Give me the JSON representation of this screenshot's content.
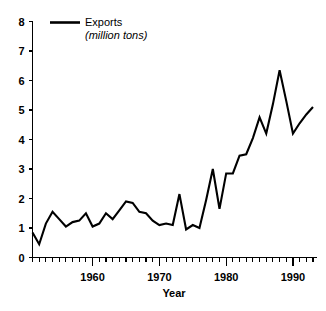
{
  "chart_data": {
    "type": "line",
    "title": "",
    "xlabel": "Year",
    "ylabel": "",
    "xlim": [
      1951,
      1993
    ],
    "ylim": [
      0,
      8
    ],
    "grid": false,
    "legend_position": "top-left-inside",
    "legend": [
      {
        "label": "Exports",
        "sublabel": "(million tons)",
        "color": "#000000"
      }
    ],
    "y_ticks": [
      0,
      1,
      2,
      3,
      4,
      5,
      6,
      7,
      8
    ],
    "y_tick_labels": [
      "0",
      "1",
      "2",
      "3",
      "4",
      "5",
      "6",
      "7",
      "8"
    ],
    "x_ticks": [
      1960,
      1970,
      1980,
      1990
    ],
    "x_tick_labels": [
      "1960",
      "1970",
      "1980",
      "1990"
    ],
    "x_minor_tick_step": 1,
    "series": [
      {
        "name": "Exports",
        "x": [
          1951,
          1952,
          1953,
          1954,
          1955,
          1956,
          1957,
          1958,
          1959,
          1960,
          1961,
          1962,
          1963,
          1964,
          1965,
          1966,
          1967,
          1968,
          1969,
          1970,
          1971,
          1972,
          1973,
          1974,
          1975,
          1976,
          1977,
          1978,
          1979,
          1980,
          1981,
          1982,
          1983,
          1984,
          1985,
          1986,
          1987,
          1988,
          1989,
          1990,
          1991,
          1992,
          1993
        ],
        "values": [
          0.85,
          0.45,
          1.15,
          1.55,
          1.3,
          1.05,
          1.2,
          1.25,
          1.5,
          1.05,
          1.15,
          1.5,
          1.3,
          1.6,
          1.9,
          1.85,
          1.55,
          1.5,
          1.25,
          1.1,
          1.15,
          1.1,
          2.15,
          0.95,
          1.1,
          1.0,
          1.95,
          3.0,
          1.65,
          2.85,
          2.85,
          3.45,
          3.5,
          4.05,
          4.75,
          4.2,
          5.2,
          6.35,
          5.3,
          4.2,
          4.55,
          4.85,
          5.1
        ]
      }
    ]
  }
}
